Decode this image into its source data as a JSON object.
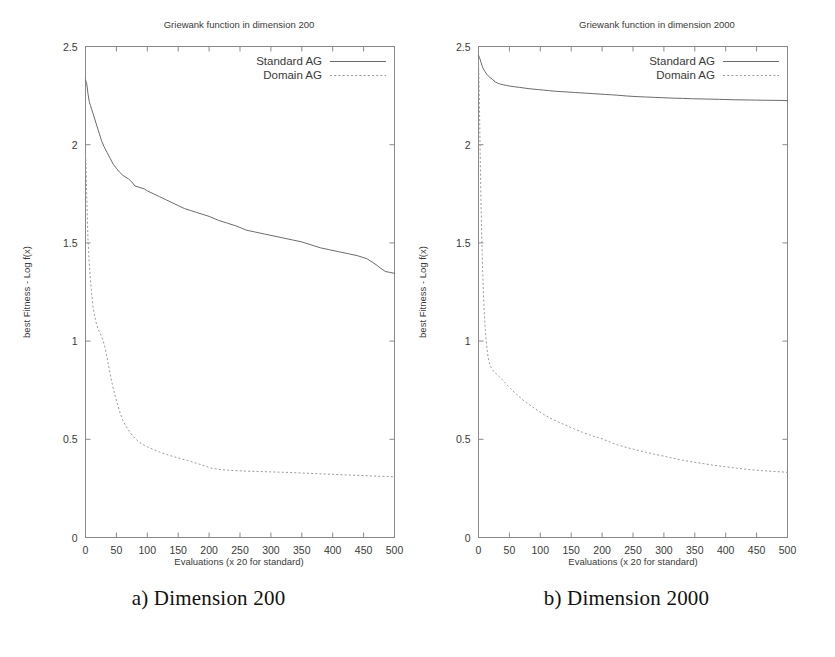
{
  "figure": {
    "caption_a": "a) Dimension 200",
    "caption_b": "b) Dimension 2000"
  },
  "chart_data": [
    {
      "type": "line",
      "panel": "a",
      "title": "Griewank function in dimension 200",
      "xlabel": "Evaluations (x 20 for standard)",
      "ylabel": "best Fitness - Log f(x)",
      "xlim": [
        0,
        500
      ],
      "ylim": [
        0,
        2.5
      ],
      "xticks": [
        0,
        50,
        100,
        150,
        200,
        250,
        300,
        350,
        400,
        450,
        500
      ],
      "xtick_labels": [
        "0",
        "50",
        "100",
        "150",
        "200",
        "250",
        "300",
        "350",
        "400",
        "450",
        "500"
      ],
      "yticks": [
        0,
        0.5,
        1,
        1.5,
        2,
        2.5
      ],
      "ytick_labels": [
        "0",
        "0.5",
        "1",
        "1.5",
        "2",
        "2.5"
      ],
      "grid": false,
      "legend_position": "top-right",
      "series": [
        {
          "name": "Standard AG",
          "style": "solid",
          "color": "#6b6b6b",
          "x": [
            0,
            2,
            4,
            6,
            8,
            10,
            12,
            15,
            18,
            22,
            26,
            30,
            35,
            40,
            45,
            50,
            55,
            60,
            65,
            70,
            75,
            80,
            85,
            90,
            95,
            100,
            110,
            120,
            130,
            140,
            150,
            160,
            170,
            180,
            190,
            200,
            215,
            230,
            245,
            260,
            275,
            290,
            305,
            320,
            335,
            350,
            365,
            380,
            395,
            410,
            425,
            440,
            455,
            465,
            472,
            478,
            485,
            492,
            500
          ],
          "y": [
            2.33,
            2.31,
            2.26,
            2.22,
            2.2,
            2.18,
            2.16,
            2.13,
            2.1,
            2.06,
            2.02,
            1.99,
            1.96,
            1.93,
            1.9,
            1.88,
            1.86,
            1.845,
            1.835,
            1.825,
            1.81,
            1.79,
            1.785,
            1.78,
            1.775,
            1.765,
            1.75,
            1.735,
            1.72,
            1.705,
            1.69,
            1.675,
            1.665,
            1.655,
            1.645,
            1.635,
            1.615,
            1.6,
            1.585,
            1.565,
            1.555,
            1.545,
            1.535,
            1.525,
            1.515,
            1.505,
            1.49,
            1.475,
            1.465,
            1.455,
            1.445,
            1.435,
            1.42,
            1.4,
            1.385,
            1.37,
            1.355,
            1.35,
            1.345
          ]
        },
        {
          "name": "Domain AG",
          "style": "dotted",
          "color": "#9a9a9a",
          "x": [
            0,
            1,
            2,
            3,
            4,
            5,
            6,
            8,
            10,
            12,
            14,
            16,
            18,
            20,
            22,
            25,
            28,
            31,
            34,
            37,
            40,
            44,
            48,
            52,
            56,
            60,
            64,
            68,
            72,
            76,
            80,
            86,
            92,
            100,
            110,
            120,
            130,
            140,
            150,
            165,
            180,
            195,
            205,
            220,
            240,
            260,
            280,
            300,
            330,
            360,
            390,
            420,
            450,
            475,
            500
          ],
          "y": [
            1.95,
            1.88,
            1.74,
            1.62,
            1.52,
            1.46,
            1.4,
            1.31,
            1.24,
            1.18,
            1.14,
            1.11,
            1.085,
            1.065,
            1.05,
            1.03,
            1.005,
            0.975,
            0.93,
            0.88,
            0.83,
            0.77,
            0.72,
            0.675,
            0.635,
            0.6,
            0.575,
            0.555,
            0.535,
            0.52,
            0.505,
            0.487,
            0.475,
            0.462,
            0.448,
            0.435,
            0.424,
            0.414,
            0.405,
            0.392,
            0.378,
            0.362,
            0.352,
            0.345,
            0.341,
            0.338,
            0.336,
            0.334,
            0.331,
            0.327,
            0.323,
            0.319,
            0.315,
            0.312,
            0.309
          ]
        }
      ]
    },
    {
      "type": "line",
      "panel": "b",
      "title": "Griewank function in dimension 2000",
      "xlabel": "Evaluations (x 20 for standard)",
      "ylabel": "best Fitness - Log f(x)",
      "xlim": [
        0,
        500
      ],
      "ylim": [
        0,
        2.5
      ],
      "xticks": [
        0,
        50,
        100,
        150,
        200,
        250,
        300,
        350,
        400,
        450,
        500
      ],
      "xtick_labels": [
        "0",
        "50",
        "100",
        "150",
        "200",
        "250",
        "300",
        "350",
        "400",
        "450",
        "500"
      ],
      "yticks": [
        0,
        0.5,
        1,
        1.5,
        2,
        2.5
      ],
      "ytick_labels": [
        "0",
        "0.5",
        "1",
        "1.5",
        "2",
        "2.5"
      ],
      "grid": false,
      "legend_position": "top-right",
      "series": [
        {
          "name": "Standard AG",
          "style": "solid",
          "color": "#6b6b6b",
          "x": [
            0,
            2,
            4,
            6,
            8,
            10,
            13,
            16,
            19,
            22,
            25,
            28,
            32,
            36,
            40,
            45,
            50,
            58,
            66,
            75,
            85,
            95,
            105,
            115,
            125,
            135,
            145,
            155,
            165,
            175,
            185,
            195,
            205,
            215,
            225,
            240,
            255,
            270,
            285,
            300,
            315,
            330,
            345,
            360,
            375,
            390,
            410,
            430,
            450,
            470,
            500
          ],
          "y": [
            2.455,
            2.44,
            2.42,
            2.4,
            2.385,
            2.375,
            2.36,
            2.35,
            2.34,
            2.335,
            2.325,
            2.318,
            2.312,
            2.308,
            2.305,
            2.302,
            2.299,
            2.295,
            2.292,
            2.288,
            2.284,
            2.281,
            2.278,
            2.275,
            2.272,
            2.27,
            2.268,
            2.266,
            2.264,
            2.262,
            2.26,
            2.258,
            2.256,
            2.254,
            2.252,
            2.248,
            2.245,
            2.243,
            2.241,
            2.239,
            2.237,
            2.236,
            2.234,
            2.233,
            2.232,
            2.231,
            2.229,
            2.228,
            2.227,
            2.226,
            2.225
          ]
        },
        {
          "name": "Domain AG",
          "style": "dotted",
          "color": "#9a9a9a",
          "x": [
            0,
            1,
            2,
            3,
            4,
            5,
            6,
            7,
            8,
            9,
            10,
            11,
            12,
            13,
            14,
            15,
            17,
            19,
            21,
            24,
            27,
            30,
            34,
            38,
            42,
            47,
            52,
            58,
            64,
            70,
            78,
            86,
            95,
            105,
            115,
            125,
            135,
            145,
            155,
            168,
            180,
            192,
            200,
            208,
            216,
            225,
            240,
            255,
            270,
            285,
            300,
            320,
            340,
            360,
            380,
            400,
            420,
            440,
            460,
            480,
            500
          ],
          "y": [
            2.43,
            2.3,
            2.1,
            1.9,
            1.72,
            1.56,
            1.44,
            1.33,
            1.24,
            1.17,
            1.11,
            1.06,
            1.02,
            0.985,
            0.955,
            0.93,
            0.895,
            0.875,
            0.862,
            0.848,
            0.838,
            0.83,
            0.818,
            0.805,
            0.792,
            0.775,
            0.758,
            0.74,
            0.722,
            0.705,
            0.686,
            0.668,
            0.648,
            0.628,
            0.61,
            0.595,
            0.58,
            0.566,
            0.553,
            0.536,
            0.522,
            0.51,
            0.503,
            0.492,
            0.482,
            0.472,
            0.458,
            0.446,
            0.435,
            0.424,
            0.414,
            0.4,
            0.388,
            0.378,
            0.368,
            0.36,
            0.352,
            0.345,
            0.34,
            0.336,
            0.332
          ]
        }
      ]
    }
  ]
}
